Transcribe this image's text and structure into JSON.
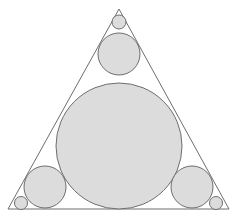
{
  "diagram": {
    "colors": {
      "background": "#ffffff",
      "stroke": "#6e6e6e",
      "circle_fill": "#dcdcdc"
    },
    "triangle": {
      "points": [
        [
          119,
          9
        ],
        [
          8,
          209
        ],
        [
          229,
          209
        ]
      ]
    },
    "circles": [
      {
        "id": "incircle",
        "cx": 119,
        "cy": 146,
        "r": 63
      },
      {
        "id": "top-medium",
        "cx": 119,
        "cy": 54,
        "r": 21
      },
      {
        "id": "top-small",
        "cx": 119,
        "cy": 22,
        "r": 7
      },
      {
        "id": "bottom-left-medium",
        "cx": 45,
        "cy": 187,
        "r": 21
      },
      {
        "id": "bottom-left-small",
        "cx": 21,
        "cy": 203,
        "r": 6.5
      },
      {
        "id": "bottom-right-medium",
        "cx": 192,
        "cy": 187,
        "r": 21
      },
      {
        "id": "bottom-right-small",
        "cx": 216,
        "cy": 203,
        "r": 6.5
      }
    ]
  }
}
